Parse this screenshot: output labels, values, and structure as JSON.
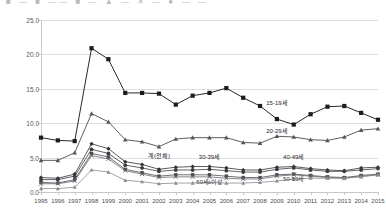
{
  "topstrip": {
    "ghost_text": "■ — ■ —— ■ — ▲ — ✕ — ● — —"
  },
  "chart_data": {
    "type": "line",
    "title": "",
    "xlabel": "",
    "ylabel": "",
    "grid": true,
    "legend_position": "inline-annotations",
    "ylim": [
      0.0,
      25.0
    ],
    "yticks": [
      "0.0",
      "5.0",
      "10.0",
      "15.0",
      "20.0",
      "25.0"
    ],
    "ytick_values": [
      0.0,
      5.0,
      10.0,
      15.0,
      20.0,
      25.0
    ],
    "x": [
      "1995",
      "1996",
      "1997",
      "1998",
      "1999",
      "2000",
      "2001",
      "2002",
      "2003",
      "2004",
      "2005",
      "2006",
      "2007",
      "2008",
      "2009",
      "2010",
      "2011",
      "2012",
      "2013",
      "2014",
      "2015"
    ],
    "series": [
      {
        "name": "15-19세",
        "color": "#1c1c20",
        "marker": "square",
        "annotation": "15-19세",
        "annotation_x": 2009,
        "annotation_y": 13.1,
        "values": [
          7.9,
          7.5,
          7.4,
          20.9,
          19.3,
          14.4,
          14.4,
          14.3,
          12.7,
          14.0,
          14.4,
          15.1,
          13.7,
          12.5,
          10.6,
          9.8,
          11.3,
          12.4,
          12.5,
          11.5,
          10.5
        ]
      },
      {
        "name": "20-29세",
        "color": "#55555b",
        "marker": "triangle",
        "annotation": "20-29세",
        "annotation_x": 2009,
        "annotation_y": 9.0,
        "values": [
          4.6,
          4.6,
          5.7,
          11.4,
          10.2,
          7.6,
          7.3,
          6.6,
          7.7,
          7.9,
          7.9,
          7.9,
          7.2,
          7.1,
          8.1,
          8.0,
          7.6,
          7.5,
          8.0,
          9.0,
          9.2
        ]
      },
      {
        "name": "계(전체)",
        "color": "#303034",
        "marker": "diamond",
        "annotation": "계(전체)",
        "annotation_x": 2002,
        "annotation_y": 5.4,
        "values": [
          2.1,
          2.0,
          2.6,
          7.0,
          6.3,
          4.4,
          4.0,
          3.3,
          3.6,
          3.7,
          3.7,
          3.5,
          3.2,
          3.2,
          3.6,
          3.7,
          3.4,
          3.2,
          3.1,
          3.5,
          3.6
        ]
      },
      {
        "name": "30-39세",
        "color": "#3a3a40",
        "marker": "circle",
        "annotation": "30-39세",
        "annotation_x": 2005,
        "annotation_y": 5.3,
        "values": [
          1.8,
          1.8,
          2.3,
          6.2,
          5.6,
          3.9,
          3.5,
          3.0,
          3.2,
          3.2,
          3.3,
          3.1,
          2.9,
          2.9,
          3.3,
          3.5,
          3.2,
          3.0,
          3.0,
          3.2,
          3.4
        ]
      },
      {
        "name": "40-49세",
        "color": "#4b4b51",
        "marker": "square-sm",
        "annotation": "40-49세",
        "annotation_x": 2010,
        "annotation_y": 5.2,
        "values": [
          1.4,
          1.3,
          1.8,
          5.6,
          5.1,
          3.3,
          2.8,
          2.3,
          2.5,
          2.5,
          2.5,
          2.3,
          2.1,
          2.1,
          2.5,
          2.6,
          2.4,
          2.2,
          2.1,
          2.4,
          2.6
        ]
      },
      {
        "name": "50-59세",
        "color": "#65656b",
        "marker": "cross",
        "annotation": "50-59세",
        "annotation_x": 2010,
        "annotation_y": 2.0,
        "values": [
          1.2,
          1.2,
          1.6,
          5.3,
          4.8,
          3.1,
          2.6,
          2.1,
          2.2,
          2.2,
          2.2,
          2.0,
          1.9,
          1.9,
          2.3,
          2.5,
          2.3,
          2.1,
          2.0,
          2.3,
          2.5
        ]
      },
      {
        "name": "60세 이상",
        "color": "#8c8c92",
        "marker": "triangle-sm",
        "annotation": "60세 이상",
        "annotation_x": 2005,
        "annotation_y": 1.6,
        "values": [
          0.5,
          0.5,
          0.7,
          3.2,
          2.9,
          1.7,
          1.5,
          1.2,
          1.3,
          1.3,
          1.4,
          1.3,
          1.3,
          1.4,
          1.6,
          1.9,
          2.0,
          2.0,
          2.0,
          2.2,
          2.5
        ]
      }
    ]
  }
}
